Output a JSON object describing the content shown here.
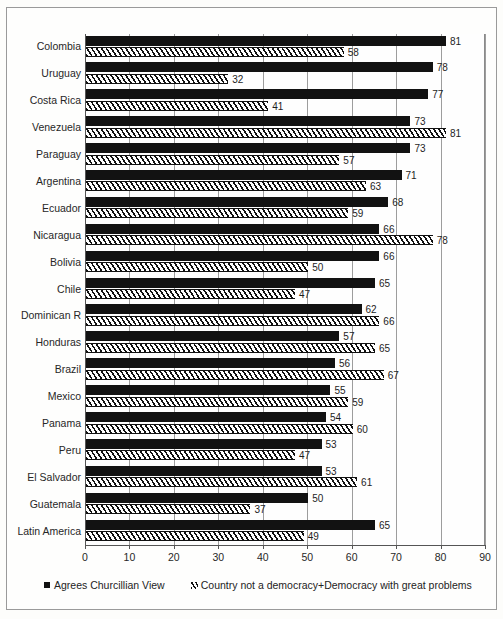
{
  "chart_data": {
    "type": "bar",
    "orientation": "horizontal",
    "title": "",
    "subtitle": "",
    "xlabel": "",
    "ylabel": "",
    "xlim": [
      0,
      90
    ],
    "xticks": [
      0,
      10,
      20,
      30,
      40,
      50,
      60,
      70,
      80,
      90
    ],
    "grid": true,
    "grid_axis": "x",
    "legend_position": "bottom-left",
    "categories": [
      "Colombia",
      "Uruguay",
      "Costa Rica",
      "Venezuela",
      "Paraguay",
      "Argentina",
      "Ecuador",
      "Nicaragua",
      "Bolivia",
      "Chile",
      "Dominican  R",
      "Honduras",
      "Brazil",
      "Mexico",
      "Panama",
      "Peru",
      "El Salvador",
      "Guatemala",
      "Latin America"
    ],
    "series": [
      {
        "name": "Agrees Churcillian View",
        "style": "solid-black",
        "color": "#121212",
        "values": [
          81,
          78,
          77,
          73,
          73,
          71,
          68,
          66,
          66,
          65,
          62,
          57,
          56,
          55,
          54,
          53,
          53,
          50,
          65
        ]
      },
      {
        "name": "Country not a democracy+Democracy with great problems",
        "style": "diagonal-hatch",
        "color": "#111111",
        "values": [
          58,
          32,
          41,
          81,
          57,
          63,
          59,
          78,
          50,
          47,
          66,
          65,
          67,
          59,
          60,
          47,
          61,
          37,
          49
        ]
      }
    ]
  },
  "legend": {
    "items": [
      {
        "marker": "solid-square-icon",
        "label": "Agrees Churcillian View"
      },
      {
        "marker": "hatch-square-icon",
        "label": "Country not a democracy+Democracy with great problems"
      }
    ]
  }
}
